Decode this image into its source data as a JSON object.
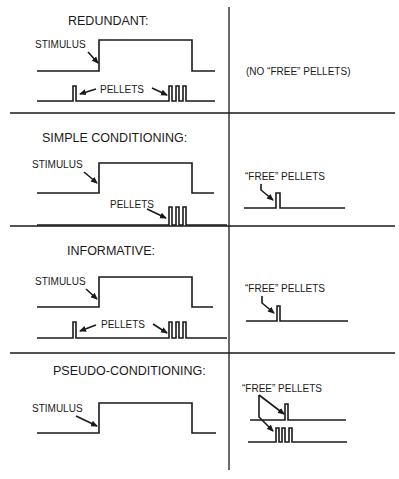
{
  "diagram": {
    "type": "timing-diagram",
    "columns": [
      "stimulus and contingent pellets",
      "free pellets"
    ],
    "panels": [
      {
        "title": "REDUNDANT:",
        "stimulus_label": "STIMULUS",
        "pellets_label": "PELLETS",
        "right_label": "(NO “FREE” PELLETS)",
        "pellet_events": "single pellet before stimulus; burst of 3 at end of stimulus"
      },
      {
        "title": "SIMPLE CONDITIONING:",
        "stimulus_label": "STIMULUS",
        "pellets_label": "PELLETS",
        "right_label": "“FREE” PELLETS",
        "pellet_events": "burst of 3 at end of stimulus; one free pellet"
      },
      {
        "title": "INFORMATIVE:",
        "stimulus_label": "STIMULUS",
        "pellets_label": "PELLETS",
        "right_label": "“FREE” PELLETS",
        "pellet_events": "single pellet before stimulus; burst of 3 at end of stimulus; one free pellet"
      },
      {
        "title": "PSEUDO-CONDITIONING:",
        "stimulus_label": "STIMULUS",
        "right_label": "“FREE” PELLETS",
        "pellet_events": "stimulus only; free single pellet and free burst of 3"
      }
    ]
  }
}
